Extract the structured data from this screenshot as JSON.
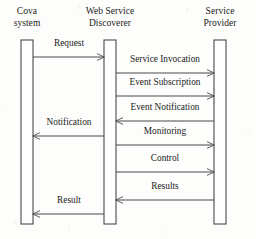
{
  "diagram": {
    "type": "uml-sequence-diagram",
    "canvas": {
      "width": 256,
      "height": 239
    },
    "colors": {
      "background": "#fdfdfc",
      "stroke": "#4a4a4a",
      "text": "#1b1b1b",
      "activation_fill": "#ffffff"
    },
    "lifelines": [
      {
        "id": "cova",
        "label": "Cova\nsystem",
        "label_line1": "Cova",
        "label_line2": "system",
        "center_x": 27,
        "label_x": 4,
        "label_y": 6,
        "label_width": 46,
        "activation": {
          "x": 21,
          "y": 40,
          "width": 12,
          "height": 184
        }
      },
      {
        "id": "discoverer",
        "label": "Web Service\nDiscoverer",
        "label_line1": "Web Service",
        "label_line2": "Discoverer",
        "center_x": 110,
        "label_x": 76,
        "label_y": 6,
        "label_width": 68,
        "activation": {
          "x": 104,
          "y": 40,
          "width": 12,
          "height": 184
        }
      },
      {
        "id": "provider",
        "label": "Service\nProvider",
        "label_line1": "Service",
        "label_line2": "Provider",
        "center_x": 220,
        "label_x": 194,
        "label_y": 6,
        "label_width": 52,
        "activation": {
          "x": 214,
          "y": 40,
          "width": 12,
          "height": 184
        }
      }
    ],
    "messages": [
      {
        "id": "request",
        "label": "Request",
        "from": "cova",
        "to": "discoverer",
        "direction": "right",
        "x1": 33,
        "x2": 104,
        "y": 57,
        "label_x": 40,
        "label_y": 38,
        "label_width": 58
      },
      {
        "id": "service-invocation",
        "label": "Service Invocation",
        "from": "discoverer",
        "to": "provider",
        "direction": "right",
        "x1": 116,
        "x2": 214,
        "y": 73,
        "label_x": 112,
        "label_y": 54,
        "label_width": 106
      },
      {
        "id": "event-subscription",
        "label": "Event Subscription",
        "from": "discoverer",
        "to": "provider",
        "direction": "right",
        "x1": 116,
        "x2": 214,
        "y": 96,
        "label_x": 112,
        "label_y": 77,
        "label_width": 106
      },
      {
        "id": "event-notification",
        "label": "Event Notification",
        "from": "provider",
        "to": "discoverer",
        "direction": "left",
        "x1": 116,
        "x2": 214,
        "y": 121,
        "label_x": 112,
        "label_y": 102,
        "label_width": 106
      },
      {
        "id": "notification",
        "label": "Notification",
        "from": "discoverer",
        "to": "cova",
        "direction": "left",
        "x1": 33,
        "x2": 104,
        "y": 136,
        "label_x": 36,
        "label_y": 117,
        "label_width": 66
      },
      {
        "id": "monitoring",
        "label": "Monitoring",
        "from": "discoverer",
        "to": "provider",
        "direction": "right",
        "x1": 116,
        "x2": 214,
        "y": 145,
        "label_x": 112,
        "label_y": 126,
        "label_width": 106
      },
      {
        "id": "control",
        "label": "Control",
        "from": "discoverer",
        "to": "provider",
        "direction": "right",
        "x1": 116,
        "x2": 214,
        "y": 172,
        "label_x": 112,
        "label_y": 153,
        "label_width": 106
      },
      {
        "id": "results",
        "label": "Results",
        "from": "provider",
        "to": "discoverer",
        "direction": "left",
        "x1": 116,
        "x2": 214,
        "y": 200,
        "label_x": 112,
        "label_y": 181,
        "label_width": 106
      },
      {
        "id": "result",
        "label": "Result",
        "from": "discoverer",
        "to": "cova",
        "direction": "left",
        "x1": 33,
        "x2": 104,
        "y": 214,
        "label_x": 40,
        "label_y": 195,
        "label_width": 58
      }
    ]
  }
}
